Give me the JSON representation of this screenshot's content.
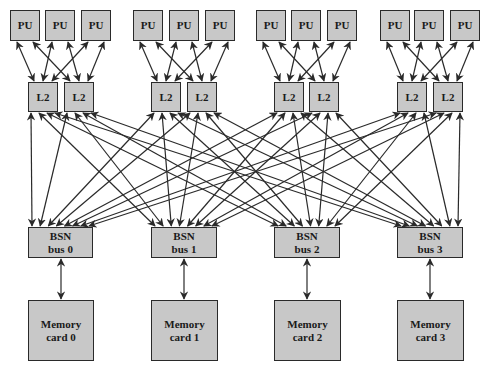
{
  "diagram": {
    "colors": {
      "box_fill": "#c8c8c8",
      "box_border": "#2a2a2a",
      "line": "#2a2a2a",
      "background": "#ffffff"
    },
    "groups": [
      {
        "pus": [
          "PU",
          "PU",
          "PU"
        ],
        "l2s": [
          "L2",
          "L2"
        ]
      },
      {
        "pus": [
          "PU",
          "PU",
          "PU"
        ],
        "l2s": [
          "L2",
          "L2"
        ]
      },
      {
        "pus": [
          "PU",
          "PU",
          "PU"
        ],
        "l2s": [
          "L2",
          "L2"
        ]
      },
      {
        "pus": [
          "PU",
          "PU",
          "PU"
        ],
        "l2s": [
          "L2",
          "L2"
        ]
      }
    ],
    "bsn": [
      {
        "line1": "BSN",
        "line2": "bus 0"
      },
      {
        "line1": "BSN",
        "line2": "bus 1"
      },
      {
        "line1": "BSN",
        "line2": "bus 2"
      },
      {
        "line1": "BSN",
        "line2": "bus 3"
      }
    ],
    "memory": [
      {
        "line1": "Memory",
        "line2": "card 0"
      },
      {
        "line1": "Memory",
        "line2": "card 1"
      },
      {
        "line1": "Memory",
        "line2": "card 2"
      },
      {
        "line1": "Memory",
        "line2": "card 3"
      }
    ],
    "connections": {
      "pu_to_l2": "each PU connects bidirectionally to both L2 caches in its group",
      "l2_to_bsn": "each L2 cache connects bidirectionally to all four BSN buses",
      "bsn_to_memory": "each BSN bus connects bidirectionally to its memory card"
    }
  }
}
